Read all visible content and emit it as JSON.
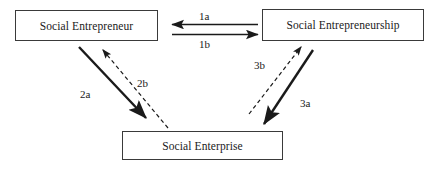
{
  "diagram": {
    "type": "relationship-diagram",
    "shape": "triangle",
    "background_color": "#ffffff",
    "stroke_color": "#1a1a1a",
    "nodes": [
      {
        "id": "social-entrepreneur",
        "label": "Social Entrepreneur",
        "position": "top-left"
      },
      {
        "id": "social-entrepreneurship",
        "label": "Social Entrepreneurship",
        "position": "top-right"
      },
      {
        "id": "social-enterprise",
        "label": "Social Enterprise",
        "position": "bottom-center"
      }
    ],
    "edges": [
      {
        "id": "1a",
        "label": "1a",
        "from": "social-entrepreneurship",
        "to": "social-entrepreneur",
        "style": "solid",
        "direction": "left"
      },
      {
        "id": "1b",
        "label": "1b",
        "from": "social-entrepreneur",
        "to": "social-entrepreneurship",
        "style": "solid",
        "direction": "right"
      },
      {
        "id": "2a",
        "label": "2a",
        "from": "social-entrepreneur",
        "to": "social-enterprise",
        "style": "solid",
        "direction": "down-right"
      },
      {
        "id": "2b",
        "label": "2b",
        "from": "social-enterprise",
        "to": "social-entrepreneur",
        "style": "dashed",
        "direction": "up-left"
      },
      {
        "id": "3a",
        "label": "3a",
        "from": "social-entrepreneurship",
        "to": "social-enterprise",
        "style": "solid",
        "direction": "down-left"
      },
      {
        "id": "3b",
        "label": "3b",
        "from": "social-enterprise",
        "to": "social-entrepreneurship",
        "style": "dashed",
        "direction": "up-right"
      }
    ]
  }
}
